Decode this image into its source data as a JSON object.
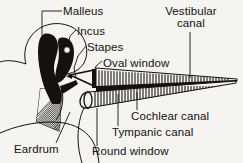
{
  "figure": {
    "background_color": "#f5f4f1",
    "ink_color": "#14110f"
  },
  "labels": {
    "malleus": "Malleus",
    "incus": "Incus",
    "stapes": "Stapes",
    "oval_window": "Oval window",
    "vestibular_canal_line1": "Vestibular",
    "vestibular_canal_line2": "canal",
    "cochlear_canal": "Cochlear  canal",
    "tympanic_canal": "Tympanic  canal",
    "round_window": "Round  window",
    "eardrum": "Eardrum"
  },
  "structures": [
    {
      "name": "malleus",
      "kind": "solid-black-ossicle"
    },
    {
      "name": "incus",
      "kind": "solid-black-ossicle-with-hole"
    },
    {
      "name": "stapes",
      "kind": "triangular-outline-ossicle"
    },
    {
      "name": "eardrum",
      "kind": "hatched-fan-membrane"
    },
    {
      "name": "oval-window",
      "kind": "opening"
    },
    {
      "name": "round-window",
      "kind": "rounded-cap-opening"
    },
    {
      "name": "vestibular-canal",
      "kind": "striated-tapering-tube"
    },
    {
      "name": "cochlear-canal",
      "kind": "black-tapering-band"
    },
    {
      "name": "tympanic-canal",
      "kind": "striated-tapering-tube"
    }
  ]
}
